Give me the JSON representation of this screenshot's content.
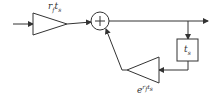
{
  "diagram": {
    "type": "block-diagram",
    "colors": {
      "stroke": "#333333",
      "background": "#ffffff"
    },
    "nodes": [
      {
        "id": "input-gain",
        "shape": "triangle",
        "label": {
          "base": "r",
          "sub": "f",
          "base2": "t",
          "sub2": "s"
        }
      },
      {
        "id": "summer",
        "shape": "circle",
        "label": "+"
      },
      {
        "id": "delay",
        "shape": "box",
        "label": {
          "base": "t",
          "sub": "s"
        }
      },
      {
        "id": "feedback-gain",
        "shape": "triangle",
        "label": {
          "base": "e",
          "sup_base": "r",
          "sup_sub": "f",
          "sup_base2": "t",
          "sup_sub2": "s"
        }
      }
    ],
    "edges": [
      {
        "from": "input",
        "to": "input-gain"
      },
      {
        "from": "input-gain",
        "to": "summer"
      },
      {
        "from": "summer",
        "to": "output"
      },
      {
        "from": "summer-output",
        "to": "delay"
      },
      {
        "from": "delay",
        "to": "feedback-gain"
      },
      {
        "from": "feedback-gain",
        "to": "summer"
      }
    ]
  }
}
